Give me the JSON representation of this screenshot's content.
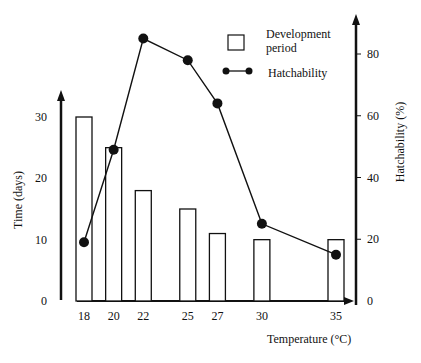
{
  "chart_data": {
    "type": "bar+line",
    "title": "",
    "xlabel": "Temperature (°C)",
    "ylabel_left": "Time (days)",
    "ylabel_right": "Hatchability (%)",
    "categories": [
      "18",
      "20",
      "22",
      "25",
      "27",
      "30",
      "35"
    ],
    "x": [
      18,
      20,
      22,
      25,
      27,
      30,
      35
    ],
    "ylim_left": [
      0,
      30
    ],
    "ylim_right": [
      0,
      80
    ],
    "yticks_left": [
      "0",
      "10",
      "20",
      "30"
    ],
    "yticks_right": [
      "0",
      "20",
      "40",
      "60",
      "80"
    ],
    "series": [
      {
        "name": "Development period",
        "type": "bar",
        "axis": "left",
        "values": [
          30,
          25,
          18,
          15,
          11,
          10,
          10
        ]
      },
      {
        "name": "Hatchability",
        "type": "line",
        "axis": "right",
        "values": [
          19,
          49,
          85,
          78,
          64,
          25,
          15
        ]
      }
    ],
    "legend": [
      {
        "label": "Development period",
        "marker": "open-square"
      },
      {
        "label": "Hatchability",
        "marker": "line-with-dots"
      }
    ],
    "legend_position": "upper-right",
    "grid": false
  },
  "legend": {
    "bar_label_line1": "Development",
    "bar_label_line2": "period",
    "line_label": "Hatchability"
  },
  "axes": {
    "x_title": "Temperature (°C)",
    "y_left_title": "Time (days)",
    "y_right_title": "Hatchability (%)"
  }
}
